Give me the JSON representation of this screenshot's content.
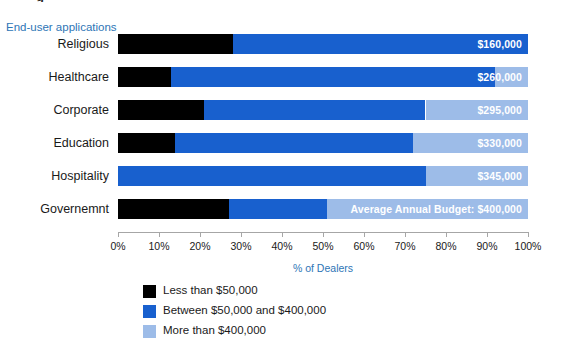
{
  "top_fragment": "g",
  "series_axis_title": "End-user applications",
  "value_axis_title": "% of Dealers",
  "colors": {
    "less_than_50k": "#000000",
    "between_50k_400k": "#1860ce",
    "more_than_400k": "#9dbce8",
    "axis_title": "#2e75b6",
    "axis_line": "#a6a6a6",
    "data_label": "#ffffff"
  },
  "legend": {
    "items": [
      {
        "label": "Less than $50,000",
        "color": "#000000"
      },
      {
        "label": "Between $50,000 and $400,000",
        "color": "#1860ce"
      },
      {
        "label": "More than $400,000",
        "color": "#9dbce8"
      }
    ]
  },
  "chart_data": {
    "type": "bar",
    "orientation": "horizontal",
    "stacked": true,
    "stacked_mode": "percent",
    "title": "",
    "xlabel": "% of Dealers",
    "ylabel": "End-user applications",
    "xlim": [
      0,
      100
    ],
    "grid": false,
    "legend_position": "bottom-left",
    "tick_labels": [
      "0%",
      "10%",
      "20%",
      "30%",
      "40%",
      "50%",
      "60%",
      "70%",
      "80%",
      "90%",
      "100%"
    ],
    "tick_values": [
      0,
      10,
      20,
      30,
      40,
      50,
      60,
      70,
      80,
      90,
      100
    ],
    "categories": [
      "Religious",
      "Healthcare",
      "Corporate",
      "Education",
      "Hospitality",
      "Governemnt"
    ],
    "series": [
      {
        "name": "Less than $50,000",
        "color": "#000000",
        "values": [
          28,
          13,
          21,
          14,
          0,
          27
        ]
      },
      {
        "name": "Between $50,000 and $400,000",
        "color": "#1860ce",
        "values": [
          72,
          79,
          54,
          58,
          75,
          24
        ]
      },
      {
        "name": "More than $400,000",
        "color": "#9dbce8",
        "values": [
          0,
          8,
          25,
          28,
          25,
          49
        ]
      }
    ],
    "data_labels": [
      "$160,000",
      "$260,000",
      "$295,000",
      "$330,000",
      "$345,000",
      "Average Annual Budget: $400,000"
    ],
    "data_label_note": "Labels show the average annual budget per end-user application, drawn in white at the right end of each bar."
  }
}
